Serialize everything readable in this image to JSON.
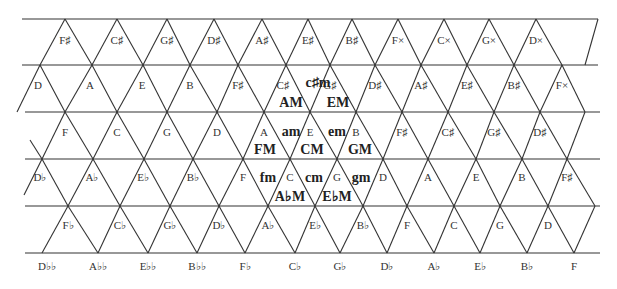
{
  "rows": [
    {
      "y": 33,
      "label_y": 44,
      "notes": [
        {
          "x": 65,
          "label": "F♯"
        },
        {
          "x": 117,
          "label": "C♯"
        },
        {
          "x": 167,
          "label": "G♯"
        },
        {
          "x": 214,
          "label": "D♯"
        },
        {
          "x": 262,
          "label": "A♯"
        },
        {
          "x": 308,
          "label": "E♯"
        },
        {
          "x": 352,
          "label": "B♯"
        },
        {
          "x": 398,
          "label": "F×"
        },
        {
          "x": 444,
          "label": "C×"
        },
        {
          "x": 489,
          "label": "G×"
        },
        {
          "x": 536,
          "label": "D×"
        }
      ]
    },
    {
      "y": 80,
      "label_y": 89,
      "notes": [
        {
          "x": 38,
          "label": "D"
        },
        {
          "x": 90,
          "label": "A"
        },
        {
          "x": 142,
          "label": "E"
        },
        {
          "x": 190,
          "label": "B"
        },
        {
          "x": 238,
          "label": "F♯"
        },
        {
          "x": 283,
          "label": "C♯"
        },
        {
          "x": 330,
          "label": "G♯"
        },
        {
          "x": 375,
          "label": "D♯"
        },
        {
          "x": 421,
          "label": "A♯"
        },
        {
          "x": 467,
          "label": "E♯"
        },
        {
          "x": 514,
          "label": "B♯"
        },
        {
          "x": 562,
          "label": "F×"
        }
      ]
    },
    {
      "y": 128,
      "label_y": 136,
      "notes": [
        {
          "x": 65,
          "label": "F"
        },
        {
          "x": 117,
          "label": "C"
        },
        {
          "x": 167,
          "label": "G"
        },
        {
          "x": 217,
          "label": "D"
        },
        {
          "x": 264,
          "label": "A"
        },
        {
          "x": 310,
          "label": "E"
        },
        {
          "x": 356,
          "label": "B"
        },
        {
          "x": 402,
          "label": "F♯"
        },
        {
          "x": 448,
          "label": "C♯"
        },
        {
          "x": 494,
          "label": "G♯"
        },
        {
          "x": 540,
          "label": "D♯"
        }
      ]
    },
    {
      "y": 177,
      "label_y": 181,
      "notes": [
        {
          "x": 40,
          "label": "D♭"
        },
        {
          "x": 92,
          "label": "A♭"
        },
        {
          "x": 143,
          "label": "E♭"
        },
        {
          "x": 193,
          "label": "B♭"
        },
        {
          "x": 243,
          "label": "F"
        },
        {
          "x": 290,
          "label": "C"
        },
        {
          "x": 337,
          "label": "G"
        },
        {
          "x": 383,
          "label": "D"
        },
        {
          "x": 428,
          "label": "A"
        },
        {
          "x": 476,
          "label": "E"
        },
        {
          "x": 522,
          "label": "B"
        },
        {
          "x": 567,
          "label": "F♯"
        }
      ]
    },
    {
      "y": 222,
      "label_y": 229,
      "notes": [
        {
          "x": 68,
          "label": "F♭"
        },
        {
          "x": 120,
          "label": "C♭"
        },
        {
          "x": 170,
          "label": "G♭"
        },
        {
          "x": 219,
          "label": "D♭"
        },
        {
          "x": 268,
          "label": "A♭"
        },
        {
          "x": 315,
          "label": "E♭"
        },
        {
          "x": 363,
          "label": "B♭"
        },
        {
          "x": 407,
          "label": "F"
        },
        {
          "x": 454,
          "label": "C"
        },
        {
          "x": 500,
          "label": "G"
        },
        {
          "x": 548,
          "label": "D"
        }
      ]
    },
    {
      "y": 270,
      "label_y": 270,
      "notes": [
        {
          "x": 47,
          "label": "D♭♭"
        },
        {
          "x": 98,
          "label": "A♭♭"
        },
        {
          "x": 148,
          "label": "E♭♭"
        },
        {
          "x": 197,
          "label": "B♭♭"
        },
        {
          "x": 245,
          "label": "F♭"
        },
        {
          "x": 295,
          "label": "C♭"
        },
        {
          "x": 340,
          "label": "G♭"
        },
        {
          "x": 387,
          "label": "D♭"
        },
        {
          "x": 434,
          "label": "A♭"
        },
        {
          "x": 480,
          "label": "E♭"
        },
        {
          "x": 527,
          "label": "B♭"
        },
        {
          "x": 574,
          "label": "F"
        }
      ]
    }
  ],
  "chords": [
    {
      "label": "c♯m",
      "x": 318,
      "y": 87
    },
    {
      "label": "AM",
      "x": 291,
      "y": 107
    },
    {
      "label": "EM",
      "x": 338,
      "y": 107
    },
    {
      "label": "am",
      "x": 291,
      "y": 136
    },
    {
      "label": "em",
      "x": 337,
      "y": 136
    },
    {
      "label": "FM",
      "x": 265,
      "y": 154
    },
    {
      "label": "CM",
      "x": 312,
      "y": 154
    },
    {
      "label": "GM",
      "x": 360,
      "y": 154
    },
    {
      "label": "fm",
      "x": 268,
      "y": 182
    },
    {
      "label": "cm",
      "x": 314,
      "y": 182
    },
    {
      "label": "gm",
      "x": 361,
      "y": 182
    },
    {
      "label": "A♭M",
      "x": 290,
      "y": 201
    },
    {
      "label": "E♭M",
      "x": 337,
      "y": 201
    }
  ],
  "grid": {
    "horizontal_lines": [
      {
        "y": 19,
        "x1": 22,
        "x2": 598
      },
      {
        "y": 65,
        "x1": 22,
        "x2": 598
      },
      {
        "y": 112,
        "x1": 25,
        "x2": 600
      },
      {
        "y": 159,
        "x1": 25,
        "x2": 600
      },
      {
        "y": 206,
        "x1": 25,
        "x2": 600
      },
      {
        "y": 253,
        "x1": 25,
        "x2": 600
      }
    ],
    "line_color": "#333333"
  }
}
